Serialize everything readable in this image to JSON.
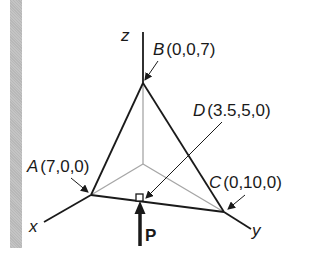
{
  "diagram": {
    "type": "3d-tetrahedron-force",
    "axes": {
      "x": "x",
      "y": "y",
      "z": "z"
    },
    "points": {
      "A": {
        "letter": "A",
        "coords": "(7,0,0)"
      },
      "B": {
        "letter": "B",
        "coords": "(0,0,7)"
      },
      "C": {
        "letter": "C",
        "coords": "(0,10,0)"
      },
      "D": {
        "letter": "D",
        "coords": "(3.5,5,0)"
      }
    },
    "force": {
      "label": "P"
    },
    "colors": {
      "edge": "#1a1a1a",
      "hidden": "#a6a6a6",
      "gutter": "#bebebe"
    }
  }
}
